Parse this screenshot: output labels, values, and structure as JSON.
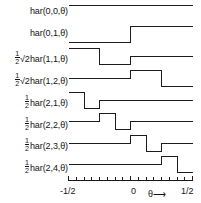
{
  "figure": {
    "title": "",
    "background": "#ffffff",
    "stroke_color": "#1c1c1c"
  },
  "axis": {
    "xlabel": "θ",
    "xlabel_arrow": "⟶",
    "xlim": [
      -0.5,
      0.5
    ],
    "tick_labels": {
      "left": "-1/2",
      "center": "0",
      "right": "1/2"
    },
    "tick_positions": [
      -0.5,
      -0.4375,
      -0.375,
      -0.3125,
      -0.25,
      -0.1875,
      -0.125,
      -0.0625,
      0,
      0.0625,
      0.125,
      0.1875,
      0.25,
      0.3125,
      0.375,
      0.4375,
      0.5
    ],
    "grid": false
  },
  "rows": [
    {
      "label_prefix": "",
      "label_radical": "",
      "label_name": "har(0,0,θ)",
      "label_full": "har(0,0,θ)"
    },
    {
      "label_prefix": "",
      "label_radical": "",
      "label_name": "har(0,1,θ)",
      "label_full": "har(0,1,θ)"
    },
    {
      "label_prefix": "1/2",
      "label_radical": "√2",
      "label_name": "har(1,1,θ)",
      "label_full": "½√2 har(1,1,θ)"
    },
    {
      "label_prefix": "1/2",
      "label_radical": "√2",
      "label_name": "har(1,2,θ)",
      "label_full": "½√2 har(1,2,θ)"
    },
    {
      "label_prefix": "1/2",
      "label_radical": "",
      "label_name": "har(2,1,θ)",
      "label_full": "½ har(2,1,θ)"
    },
    {
      "label_prefix": "1/2",
      "label_radical": "",
      "label_name": "har(2,2,θ)",
      "label_full": "½ har(2,2,θ)"
    },
    {
      "label_prefix": "1/2",
      "label_radical": "",
      "label_name": "har(2,3,θ)",
      "label_full": "½ har(2,3,θ)"
    },
    {
      "label_prefix": "1/2",
      "label_radical": "",
      "label_name": "har(2,4,θ)",
      "label_full": "½ har(2,4,θ)"
    }
  ],
  "chart_data": {
    "type": "line",
    "xlabel": "θ",
    "ylabel": "",
    "xlim": [
      -0.5,
      0.5
    ],
    "grid": false,
    "legend": "none",
    "note": "Eight stacked step-function subplots; each series is a piecewise-constant Haar basis function plotted against θ on [-1/2, 1/2]. Values given as (x_start, x_end, y) segments in units of the common amplitude.",
    "series": [
      {
        "name": "har(0,0,θ)",
        "index": 0,
        "baseline": 0,
        "segments": [
          {
            "x0": -0.5,
            "x1": 0.5,
            "y": 1
          }
        ]
      },
      {
        "name": "har(0,1,θ)",
        "index": 1,
        "baseline": 0,
        "segments": [
          {
            "x0": -0.5,
            "x1": 0.0,
            "y": -1
          },
          {
            "x0": 0.0,
            "x1": 0.5,
            "y": 1
          }
        ]
      },
      {
        "name": "½√2 har(1,1,θ)",
        "index": 2,
        "baseline": 0,
        "segments": [
          {
            "x0": -0.5,
            "x1": -0.25,
            "y": 1
          },
          {
            "x0": -0.25,
            "x1": 0.0,
            "y": -1
          },
          {
            "x0": 0.0,
            "x1": 0.5,
            "y": 0
          }
        ]
      },
      {
        "name": "½√2 har(1,2,θ)",
        "index": 3,
        "baseline": 0,
        "segments": [
          {
            "x0": -0.5,
            "x1": 0.0,
            "y": 0
          },
          {
            "x0": 0.0,
            "x1": 0.25,
            "y": 1
          },
          {
            "x0": 0.25,
            "x1": 0.5,
            "y": -1
          }
        ]
      },
      {
        "name": "½ har(2,1,θ)",
        "index": 4,
        "baseline": 0,
        "segments": [
          {
            "x0": -0.5,
            "x1": -0.375,
            "y": 1
          },
          {
            "x0": -0.375,
            "x1": -0.25,
            "y": -1
          },
          {
            "x0": -0.25,
            "x1": 0.5,
            "y": 0
          }
        ]
      },
      {
        "name": "½ har(2,2,θ)",
        "index": 5,
        "baseline": 0,
        "segments": [
          {
            "x0": -0.5,
            "x1": -0.25,
            "y": 0
          },
          {
            "x0": -0.25,
            "x1": -0.125,
            "y": 1
          },
          {
            "x0": -0.125,
            "x1": 0.0,
            "y": -1
          },
          {
            "x0": 0.0,
            "x1": 0.5,
            "y": 0
          }
        ]
      },
      {
        "name": "½ har(2,3,θ)",
        "index": 6,
        "baseline": 0,
        "segments": [
          {
            "x0": -0.5,
            "x1": 0.0,
            "y": 0
          },
          {
            "x0": 0.0,
            "x1": 0.125,
            "y": 1
          },
          {
            "x0": 0.125,
            "x1": 0.25,
            "y": -1
          },
          {
            "x0": 0.25,
            "x1": 0.5,
            "y": 0
          }
        ]
      },
      {
        "name": "½ har(2,4,θ)",
        "index": 7,
        "baseline": 0,
        "segments": [
          {
            "x0": -0.5,
            "x1": 0.25,
            "y": 0
          },
          {
            "x0": 0.25,
            "x1": 0.375,
            "y": 1
          },
          {
            "x0": 0.375,
            "x1": 0.5,
            "y": -1
          }
        ]
      }
    ]
  }
}
